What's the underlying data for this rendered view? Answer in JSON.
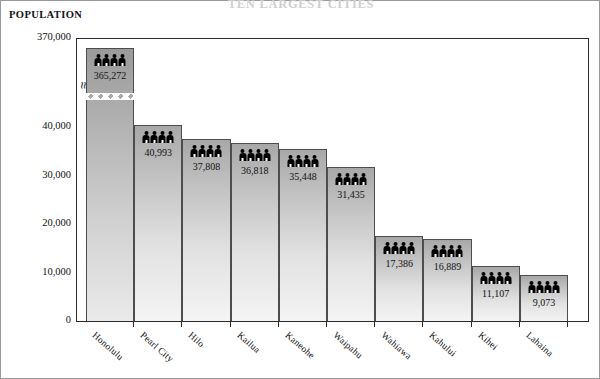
{
  "chart_title": "TEN LARGEST CITIES",
  "axis_title": "POPULATION",
  "total": {
    "label": "TOTAL POPULATION:",
    "value": "1,160,000   (1995 estimated)"
  },
  "y_axis": {
    "ticks": [
      "370,000",
      "40,000",
      "30,000",
      "20,000",
      "10,000",
      "0"
    ]
  },
  "chart_data": {
    "type": "bar",
    "title": "TEN LARGEST CITIES",
    "xlabel": "",
    "ylabel": "POPULATION",
    "ylim": [
      0,
      45000
    ],
    "axis_break": true,
    "axis_break_note": "y-axis broken between 40,000 and 370,000; Honolulu bar truncated with zigzag",
    "grid": false,
    "legend": "none",
    "categories": [
      "Honolulu",
      "Pearl City",
      "Hilo",
      "Kailua",
      "Kaneohe",
      "Waipahu",
      "Wahiawa",
      "Kahului",
      "Kihei",
      "Lahaina"
    ],
    "values": [
      365272,
      40993,
      37808,
      36818,
      35448,
      31435,
      17386,
      16889,
      11107,
      9073
    ],
    "value_labels": [
      "365,272",
      "40,993",
      "37,808",
      "36,818",
      "35,448",
      "31,435",
      "17,386",
      "16,889",
      "11,107",
      "9,073"
    ],
    "tick_labels": [
      "0",
      "10,000",
      "20,000",
      "30,000",
      "40,000",
      "370,000"
    ],
    "annotations": [
      "TOTAL POPULATION: 1,160,000 (1995 estimated)"
    ]
  },
  "bars": [
    {
      "name": "Honolulu",
      "label": "Honolulu",
      "value_label": "365,272",
      "top_px": 48,
      "shade": "dark"
    },
    {
      "name": "Pearl City",
      "label": "Pearl City",
      "value_label": "40,993",
      "top_px": 125,
      "shade": "light"
    },
    {
      "name": "Hilo",
      "label": "Hilo",
      "value_label": "37,808",
      "top_px": 139,
      "shade": "light"
    },
    {
      "name": "Kailua",
      "label": "Kailua",
      "value_label": "36,818",
      "top_px": 143,
      "shade": "light"
    },
    {
      "name": "Kaneohe",
      "label": "Kaneohe",
      "value_label": "35,448",
      "top_px": 149,
      "shade": "light"
    },
    {
      "name": "Waipahu",
      "label": "Waipahu",
      "value_label": "31,435",
      "top_px": 167,
      "shade": "light"
    },
    {
      "name": "Wahiawa",
      "label": "Wahiawa",
      "value_label": "17,386",
      "top_px": 236,
      "shade": "light"
    },
    {
      "name": "Kahului",
      "label": "Kahului",
      "value_label": "16,889",
      "top_px": 239,
      "shade": "light"
    },
    {
      "name": "Kihei",
      "label": "Kihei",
      "value_label": "11,107",
      "top_px": 266,
      "shade": "light"
    },
    {
      "name": "Lahaina",
      "label": "Lahaina",
      "value_label": "9,073",
      "top_px": 275,
      "shade": "light"
    }
  ],
  "icon": {
    "name": "people-icon",
    "count": 4
  }
}
